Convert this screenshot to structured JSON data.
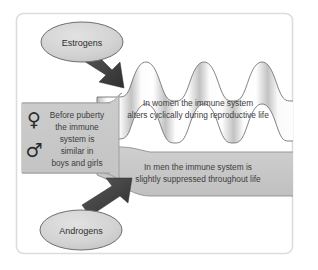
{
  "figure": {
    "frame": {
      "border_color": "#d8d8d8",
      "background": "#ffffff"
    },
    "colors": {
      "panel_gray": "#c9c9c9",
      "band_men_gray": "#c6c6c6",
      "band_women_light": "#fbfbfb",
      "band_women_shade": "#bdbdbd",
      "ellipse_fill": "#d2d2d2",
      "ellipse_stroke": "#6e6e6e",
      "arrow_fill": "#4a4a4a",
      "outline": "#5a5a5a",
      "text": "#3a3a3a"
    }
  },
  "nodes": {
    "estrogens": {
      "label": "Estrogens",
      "role": "hormone-source-female"
    },
    "androgens": {
      "label": "Androgens",
      "role": "hormone-source-male"
    }
  },
  "panel": {
    "symbols": {
      "female": "♀",
      "male": "♂"
    },
    "lines": [
      "Before puberty",
      "the immune",
      "system is",
      "similar in",
      "boys and girls"
    ]
  },
  "bands": {
    "women": {
      "lines": [
        "In women the immune system",
        "alters cyclically during reproductive life"
      ],
      "shape": "wavy",
      "wave_periods": 4.5
    },
    "men": {
      "lines": [
        "In men the immune system is",
        "slightly suppressed throughout life"
      ],
      "shape": "flat"
    }
  },
  "arrows": {
    "estrogens_to_women": {
      "direction": "down-right",
      "name": "estrogens-arrow"
    },
    "androgens_to_men": {
      "direction": "up-right",
      "name": "androgens-arrow"
    }
  }
}
